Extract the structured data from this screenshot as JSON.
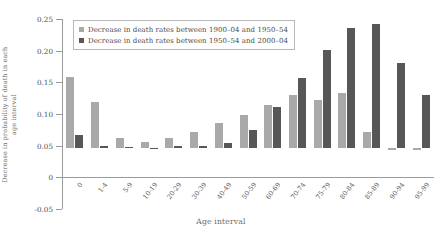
{
  "chart_data": {
    "type": "bar",
    "title": "",
    "xlabel": "Age interval",
    "ylabel": "Decrease in probability of death in each age interval",
    "ylim": [
      -0.05,
      0.25
    ],
    "yticks": [
      -0.05,
      0,
      0.05,
      0.1,
      0.15,
      0.2,
      0.25
    ],
    "ytick_labels": [
      "-0.05",
      "0",
      "0.05",
      "0.10",
      "0.15",
      "0.20",
      "0.25"
    ],
    "grid": false,
    "legend_position": "top-left",
    "categories": [
      "0",
      "1-4",
      "5-9",
      "10-19",
      "20-29",
      "30-39",
      "40-49",
      "50-59",
      "60-69",
      "70-74",
      "75-79",
      "80-84",
      "85-89",
      "90-94",
      "95-99"
    ],
    "series": [
      {
        "name": "Decrease in death rates between 1900-04 and 1950-54",
        "color": "#a9a9a9",
        "values": [
          0.112,
          0.073,
          0.017,
          0.01,
          0.017,
          0.026,
          0.04,
          0.052,
          0.068,
          0.085,
          0.077,
          0.087,
          0.026,
          -0.002,
          -0.003
        ]
      },
      {
        "name": "Decrease in death rates between 1950-54 and 2000-04",
        "color": "#575757",
        "values": [
          0.021,
          0.003,
          0.002,
          0.001,
          0.003,
          0.004,
          0.009,
          0.029,
          0.066,
          0.111,
          0.155,
          0.19,
          0.197,
          0.135,
          0.085
        ]
      }
    ]
  },
  "legend": {
    "items": [
      {
        "label": "Decrease in death rates between 1900–04 and 1950–54"
      },
      {
        "label": "Decrease in death rates between 1950–54 and 2000–04"
      }
    ]
  },
  "axes": {
    "x_title": "Age interval",
    "y_title": "Decrease in probability of death in each age interval"
  }
}
